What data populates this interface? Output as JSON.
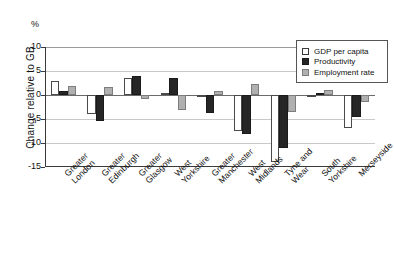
{
  "chart_data": {
    "type": "bar",
    "title": "",
    "xlabel": "",
    "ylabel": "Change relative to GB",
    "unit_symbol": "%",
    "ylim": [
      -15,
      10
    ],
    "yticks": [
      10,
      5,
      0,
      -5,
      -10,
      -15
    ],
    "ytick_labels": [
      "10",
      "5",
      "0",
      "-5",
      "-10",
      "-15"
    ],
    "grid": true,
    "legend_position": "top-right",
    "categories": [
      "Greater London",
      "Greater Edinburgh",
      "Greater Glasgow",
      "West Yorkshire",
      "Greater Manchester",
      "West Midlands",
      "Tyne and Wear",
      "South Yorkshire",
      "Merseyside"
    ],
    "series": [
      {
        "name": "GDP per capita",
        "color": "#ffffff",
        "values": [
          2.9,
          -4.0,
          3.5,
          0.4,
          -0.2,
          -7.5,
          -14.0,
          -0.3,
          -6.8
        ]
      },
      {
        "name": "Productivity",
        "color": "#262626",
        "values": [
          0.8,
          -5.4,
          4.0,
          3.6,
          -3.7,
          -8.2,
          -11.0,
          0.5,
          -4.5
        ]
      },
      {
        "name": "Employment rate",
        "color": "#b0b0b0",
        "values": [
          1.9,
          1.7,
          -0.8,
          -3.2,
          0.9,
          2.3,
          -3.5,
          1.0,
          -1.5
        ]
      }
    ]
  },
  "legend": {
    "items": [
      {
        "label": "GDP per capita",
        "key": "gdp"
      },
      {
        "label": "Productivity",
        "key": "prod"
      },
      {
        "label": "Employment rate",
        "key": "emp"
      }
    ]
  }
}
